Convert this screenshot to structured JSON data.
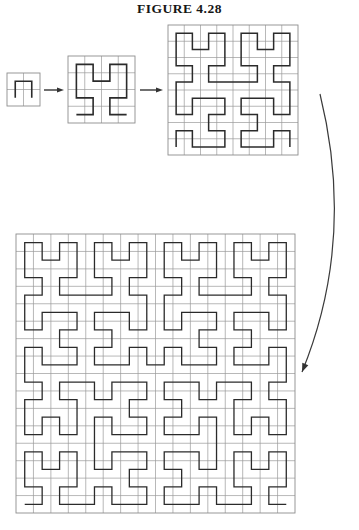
{
  "figure": {
    "title": "FIGURE 4.28",
    "caption_visible": false,
    "background_color": "#ffffff",
    "curve_color": "#2b2b2b",
    "grid_color": "#9a9a9a",
    "arrow_color": "#333333"
  },
  "stages": [
    {
      "name": "stage-1",
      "order": 1,
      "grid_divisions": 2,
      "cells": 4,
      "segments": 3,
      "x": 7,
      "y": 73,
      "size": 33,
      "stroke_width": 1.6
    },
    {
      "name": "stage-2",
      "order": 2,
      "grid_divisions": 4,
      "cells": 16,
      "segments": 15,
      "x": 68,
      "y": 56,
      "size": 67,
      "stroke_width": 1.6
    },
    {
      "name": "stage-3",
      "order": 3,
      "grid_divisions": 8,
      "cells": 64,
      "segments": 63,
      "x": 168,
      "y": 25,
      "size": 130,
      "stroke_width": 1.5
    },
    {
      "name": "stage-4",
      "order": 4,
      "grid_divisions": 16,
      "cells": 256,
      "segments": 255,
      "x": 16,
      "y": 234,
      "size": 279,
      "stroke_width": 1.3
    }
  ],
  "arrows": [
    {
      "name": "arrow-stage1-to-stage2",
      "type": "straight",
      "x1": 44,
      "y1": 90,
      "x2": 64,
      "y2": 90
    },
    {
      "name": "arrow-stage2-to-stage3",
      "type": "straight",
      "x1": 140,
      "y1": 90,
      "x2": 163,
      "y2": 90
    },
    {
      "name": "arrow-stage3-to-stage4",
      "type": "curved",
      "x1": 320,
      "y1": 94,
      "cx": 356,
      "cy": 240,
      "x2": 302,
      "y2": 372
    }
  ]
}
